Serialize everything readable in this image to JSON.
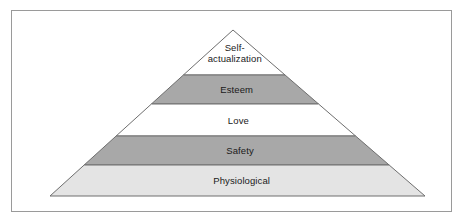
{
  "figure": {
    "kind": "pyramid-diagram",
    "frame": {
      "border_color": "#9a9a9a",
      "background": "#ffffff"
    },
    "geometry": {
      "apex": [
        233,
        30
      ],
      "base_left": [
        50,
        196
      ],
      "base_right": [
        425,
        196
      ],
      "divider_y": [
        75,
        104,
        136,
        165
      ],
      "outline_color": "#6e6e6e"
    },
    "tiers": [
      {
        "label": "Self-\nactualization",
        "label_lines": [
          "Self-",
          "actualization"
        ],
        "fill": "#ffffff",
        "level": 5
      },
      {
        "label": "Esteem",
        "label_lines": [
          "Esteem"
        ],
        "fill": "#a8a8a8",
        "level": 4
      },
      {
        "label": "Love",
        "label_lines": [
          "Love"
        ],
        "fill": "#ffffff",
        "level": 3
      },
      {
        "label": "Safety",
        "label_lines": [
          "Safety"
        ],
        "fill": "#a8a8a8",
        "level": 2
      },
      {
        "label": "Physiological",
        "label_lines": [
          "Physiological"
        ],
        "fill": "#e4e4e4",
        "level": 1
      }
    ]
  }
}
